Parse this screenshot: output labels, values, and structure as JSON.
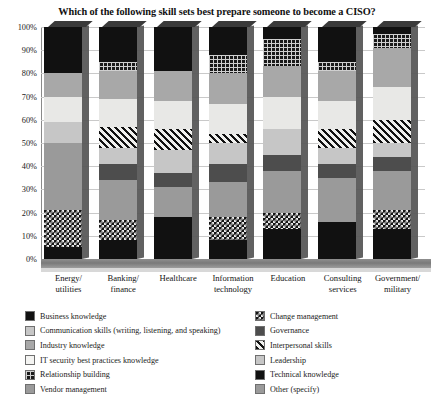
{
  "chart_data": {
    "type": "bar",
    "subtype": "stacked-100-percent",
    "title": "Which of the following skill sets best prepare someone to become a CISO?",
    "xlabel": "",
    "ylabel": "",
    "ylim": [
      0,
      100
    ],
    "yticks": [
      "0%",
      "10%",
      "20%",
      "30%",
      "40%",
      "50%",
      "60%",
      "70%",
      "80%",
      "90%",
      "100%"
    ],
    "grid": true,
    "legend_position": "bottom",
    "categories": [
      "Energy/ utilities",
      "Banking/ finance",
      "Healthcare",
      "Information technology",
      "Education",
      "Consulting services",
      "Government/ military"
    ],
    "category_lines": [
      [
        "Energy/",
        "utilities"
      ],
      [
        "Banking/",
        "finance"
      ],
      [
        "Healthcare",
        ""
      ],
      [
        "Information",
        "technology"
      ],
      [
        "Education",
        ""
      ],
      [
        "Consulting",
        "services"
      ],
      [
        "Government/",
        "military"
      ]
    ],
    "series": [
      {
        "name": "Business knowledge",
        "fill": "f-black",
        "values": [
          5,
          8,
          18,
          7,
          10,
          14,
          10
        ]
      },
      {
        "name": "Relationship building",
        "fill": "f-checker",
        "values": [
          16,
          9,
          0,
          10,
          7,
          0,
          9
        ]
      },
      {
        "name": "Vendor management",
        "fill": "f-midgray",
        "values": [
          0,
          12,
          12,
          0,
          13,
          12,
          10
        ]
      },
      {
        "name": "Governance",
        "fill": "f-darkgray",
        "values": [
          0,
          6,
          5,
          7,
          5,
          5,
          5
        ]
      },
      {
        "name": "Leadership",
        "fill": "f-lightgray",
        "values": [
          20,
          6,
          8,
          10,
          11,
          10,
          6
        ]
      },
      {
        "name": "Interpersonal skills",
        "fill": "f-diag",
        "values": [
          0,
          7,
          8,
          4,
          0,
          6,
          8
        ]
      },
      {
        "name": "IT security best practices knowledge",
        "fill": "f-paleblue",
        "values": [
          11,
          13,
          12,
          14,
          14,
          13,
          14
        ]
      },
      {
        "name": "Industry knowledge",
        "fill": "f-gray",
        "values": [
          0,
          0,
          0,
          0,
          0,
          0,
          0
        ]
      },
      {
        "name": "Communication skills (writing, listening, and speaking)",
        "fill": "f-lightgray",
        "values": [
          0,
          0,
          0,
          0,
          0,
          0,
          0
        ]
      },
      {
        "name": "Governance (upper)",
        "fill": "f-gray",
        "values": [
          10,
          15,
          15,
          15,
          12,
          15,
          19
        ]
      },
      {
        "name": "Change management",
        "fill": "f-grid",
        "values": [
          0,
          4,
          0,
          5,
          12,
          4,
          6
        ]
      },
      {
        "name": "Technical knowledge",
        "fill": "f-black",
        "values": [
          38,
          20,
          22,
          28,
          16,
          21,
          13
        ]
      }
    ],
    "bars": [
      {
        "category": "Energy/ utilities",
        "segments": [
          {
            "name": "Technical knowledge",
            "fill": "f-black",
            "from": 80,
            "to": 100
          },
          {
            "name": "Governance (upper)",
            "fill": "f-gray",
            "from": 70,
            "to": 80
          },
          {
            "name": "IT security best practices knowledge",
            "fill": "f-paleblue",
            "from": 59,
            "to": 70
          },
          {
            "name": "Leadership",
            "fill": "f-lightgray",
            "from": 50,
            "to": 59
          },
          {
            "name": "Vendor management",
            "fill": "f-midgray",
            "from": 21,
            "to": 50
          },
          {
            "name": "Relationship building",
            "fill": "f-checker",
            "from": 5,
            "to": 21
          },
          {
            "name": "Business knowledge",
            "fill": "f-black",
            "from": 0,
            "to": 5
          }
        ]
      },
      {
        "category": "Banking/ finance",
        "segments": [
          {
            "name": "Technical knowledge",
            "fill": "f-black",
            "from": 85,
            "to": 100
          },
          {
            "name": "Change management",
            "fill": "f-grid",
            "from": 81,
            "to": 85
          },
          {
            "name": "Governance (upper)",
            "fill": "f-gray",
            "from": 69,
            "to": 81
          },
          {
            "name": "IT security best practices knowledge",
            "fill": "f-paleblue",
            "from": 57,
            "to": 69
          },
          {
            "name": "Interpersonal skills",
            "fill": "f-diag",
            "from": 48,
            "to": 57
          },
          {
            "name": "Leadership",
            "fill": "f-lightgray",
            "from": 41,
            "to": 48
          },
          {
            "name": "Governance",
            "fill": "f-darkgray",
            "from": 34,
            "to": 41
          },
          {
            "name": "Vendor management",
            "fill": "f-midgray",
            "from": 17,
            "to": 34
          },
          {
            "name": "Relationship building",
            "fill": "f-checker",
            "from": 8,
            "to": 17
          },
          {
            "name": "Business knowledge",
            "fill": "f-black",
            "from": 0,
            "to": 8
          }
        ]
      },
      {
        "category": "Healthcare",
        "segments": [
          {
            "name": "Technical knowledge",
            "fill": "f-black",
            "from": 81,
            "to": 100
          },
          {
            "name": "Governance (upper)",
            "fill": "f-gray",
            "from": 68,
            "to": 81
          },
          {
            "name": "IT security best practices knowledge",
            "fill": "f-paleblue",
            "from": 56,
            "to": 68
          },
          {
            "name": "Interpersonal skills",
            "fill": "f-diag",
            "from": 47,
            "to": 56
          },
          {
            "name": "Leadership",
            "fill": "f-lightgray",
            "from": 37,
            "to": 47
          },
          {
            "name": "Governance",
            "fill": "f-darkgray",
            "from": 31,
            "to": 37
          },
          {
            "name": "Vendor management",
            "fill": "f-midgray",
            "from": 18,
            "to": 31
          },
          {
            "name": "Business knowledge",
            "fill": "f-black",
            "from": 0,
            "to": 18
          }
        ]
      },
      {
        "category": "Information technology",
        "segments": [
          {
            "name": "Technical knowledge",
            "fill": "f-black",
            "from": 88,
            "to": 100
          },
          {
            "name": "Change management",
            "fill": "f-grid",
            "from": 80,
            "to": 88
          },
          {
            "name": "Governance (upper)",
            "fill": "f-gray",
            "from": 67,
            "to": 80
          },
          {
            "name": "IT security best practices knowledge",
            "fill": "f-paleblue",
            "from": 54,
            "to": 67
          },
          {
            "name": "Interpersonal skills",
            "fill": "f-diag",
            "from": 50,
            "to": 54
          },
          {
            "name": "Leadership",
            "fill": "f-lightgray",
            "from": 41,
            "to": 50
          },
          {
            "name": "Governance",
            "fill": "f-darkgray",
            "from": 33,
            "to": 41
          },
          {
            "name": "Vendor management",
            "fill": "f-midgray",
            "from": 18,
            "to": 33
          },
          {
            "name": "Relationship building",
            "fill": "f-checker",
            "from": 8,
            "to": 18
          },
          {
            "name": "Business knowledge",
            "fill": "f-black",
            "from": 0,
            "to": 8
          }
        ]
      },
      {
        "category": "Education",
        "segments": [
          {
            "name": "Technical knowledge",
            "fill": "f-black",
            "from": 95,
            "to": 100
          },
          {
            "name": "Change management",
            "fill": "f-grid",
            "from": 83,
            "to": 95
          },
          {
            "name": "Governance (upper)",
            "fill": "f-gray",
            "from": 70,
            "to": 83
          },
          {
            "name": "IT security best practices knowledge",
            "fill": "f-paleblue",
            "from": 56,
            "to": 70
          },
          {
            "name": "Leadership",
            "fill": "f-lightgray",
            "from": 45,
            "to": 56
          },
          {
            "name": "Governance",
            "fill": "f-darkgray",
            "from": 38,
            "to": 45
          },
          {
            "name": "Vendor management",
            "fill": "f-midgray",
            "from": 20,
            "to": 38
          },
          {
            "name": "Relationship building",
            "fill": "f-checker",
            "from": 13,
            "to": 20
          },
          {
            "name": "Business knowledge",
            "fill": "f-black",
            "from": 0,
            "to": 13
          }
        ]
      },
      {
        "category": "Consulting services",
        "segments": [
          {
            "name": "Technical knowledge",
            "fill": "f-black",
            "from": 85,
            "to": 100
          },
          {
            "name": "Change management",
            "fill": "f-grid",
            "from": 81,
            "to": 85
          },
          {
            "name": "Governance (upper)",
            "fill": "f-gray",
            "from": 68,
            "to": 81
          },
          {
            "name": "IT security best practices knowledge",
            "fill": "f-paleblue",
            "from": 56,
            "to": 68
          },
          {
            "name": "Interpersonal skills",
            "fill": "f-diag",
            "from": 48,
            "to": 56
          },
          {
            "name": "Leadership",
            "fill": "f-lightgray",
            "from": 41,
            "to": 48
          },
          {
            "name": "Governance",
            "fill": "f-darkgray",
            "from": 35,
            "to": 41
          },
          {
            "name": "Vendor management",
            "fill": "f-midgray",
            "from": 16,
            "to": 35
          },
          {
            "name": "Business knowledge",
            "fill": "f-black",
            "from": 0,
            "to": 16
          }
        ]
      },
      {
        "category": "Government/ military",
        "segments": [
          {
            "name": "Technical knowledge",
            "fill": "f-black",
            "from": 97,
            "to": 100
          },
          {
            "name": "Change management",
            "fill": "f-grid",
            "from": 91,
            "to": 97
          },
          {
            "name": "Governance (upper)",
            "fill": "f-gray",
            "from": 74,
            "to": 91
          },
          {
            "name": "IT security best practices knowledge",
            "fill": "f-paleblue",
            "from": 60,
            "to": 74
          },
          {
            "name": "Interpersonal skills",
            "fill": "f-diag",
            "from": 50,
            "to": 60
          },
          {
            "name": "Leadership",
            "fill": "f-lightgray",
            "from": 44,
            "to": 50
          },
          {
            "name": "Governance",
            "fill": "f-darkgray",
            "from": 38,
            "to": 44
          },
          {
            "name": "Vendor management",
            "fill": "f-midgray",
            "from": 21,
            "to": 38
          },
          {
            "name": "Relationship building",
            "fill": "f-checker",
            "from": 13,
            "to": 21
          },
          {
            "name": "Business knowledge",
            "fill": "f-black",
            "from": 0,
            "to": 13
          }
        ]
      }
    ],
    "legend": {
      "left_column": [
        {
          "label": "Business knowledge",
          "fill": "f-black"
        },
        {
          "label": "Communication skills (writing, listening, and speaking)",
          "fill": "f-lightgray"
        },
        {
          "label": "Industry knowledge",
          "fill": "f-gray"
        },
        {
          "label": "IT security best practices knowledge",
          "fill": "f-white"
        },
        {
          "label": "Relationship building",
          "fill": "f-grid"
        },
        {
          "label": "Vendor management",
          "fill": "f-midgray"
        }
      ],
      "right_column": [
        {
          "label": "Change management",
          "fill": "f-checker"
        },
        {
          "label": "Governance",
          "fill": "f-darkgray"
        },
        {
          "label": "Interpersonal skills",
          "fill": "f-diag"
        },
        {
          "label": "Leadership",
          "fill": "f-lightgray"
        },
        {
          "label": "Technical knowledge",
          "fill": "f-black"
        },
        {
          "label": "Other (specify)",
          "fill": "f-midgray"
        }
      ]
    }
  }
}
